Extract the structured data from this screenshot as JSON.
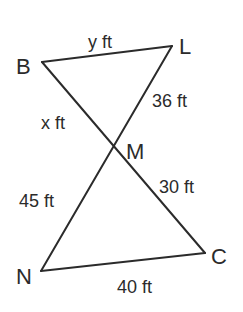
{
  "diagram": {
    "type": "two triangles sharing vertex M (vertical angles)",
    "vertices": {
      "B": {
        "label": "B",
        "x": 42,
        "y": 62
      },
      "L": {
        "label": "L",
        "x": 172,
        "y": 46
      },
      "M": {
        "label": "M",
        "x": 113,
        "y": 143
      },
      "N": {
        "label": "N",
        "x": 41,
        "y": 271
      },
      "C": {
        "label": "C",
        "x": 205,
        "y": 253
      }
    },
    "segments": {
      "BL": {
        "from": "B",
        "to": "L",
        "length_label": "y ft"
      },
      "LM": {
        "from": "L",
        "to": "M",
        "length_label": "36 ft"
      },
      "BM": {
        "from": "B",
        "to": "M",
        "length_label": "x ft"
      },
      "MN": {
        "from": "M",
        "to": "N",
        "length_label": "45 ft"
      },
      "MC": {
        "from": "M",
        "to": "C",
        "length_label": "30 ft"
      },
      "NC": {
        "from": "N",
        "to": "C",
        "length_label": "40 ft"
      }
    },
    "stroke_color": "#2b2b2b",
    "background_color": "#ffffff"
  }
}
